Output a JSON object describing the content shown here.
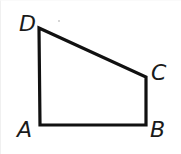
{
  "figure": {
    "kind": "geometry-diagram",
    "shape_name": "quadrilateral",
    "canvas": {
      "width": 181,
      "height": 154,
      "background": "#ffffff"
    },
    "stroke": {
      "color": "#111111",
      "width": 3.2,
      "linejoin": "miter",
      "linecap": "butt"
    },
    "vertices": [
      {
        "id": "A",
        "label": "A",
        "x": 39,
        "y": 124,
        "label_x": 16,
        "label_y": 118
      },
      {
        "id": "B",
        "label": "B",
        "x": 145,
        "y": 124,
        "label_x": 149,
        "label_y": 118
      },
      {
        "id": "C",
        "label": "C",
        "x": 145,
        "y": 76,
        "label_x": 150,
        "label_y": 61
      },
      {
        "id": "D",
        "label": "D",
        "x": 38,
        "y": 27,
        "label_x": 18,
        "label_y": 12
      }
    ],
    "edges": [
      {
        "from": "A",
        "to": "B",
        "name": "side-AB"
      },
      {
        "from": "B",
        "to": "C",
        "name": "side-BC"
      },
      {
        "from": "C",
        "to": "D",
        "name": "side-CD"
      },
      {
        "from": "D",
        "to": "A",
        "name": "side-DA"
      }
    ],
    "path": "M 38,27 L 145,76 L 145,124 L 39,124 Z",
    "artifacts": [
      {
        "id": "speck-1",
        "x": 57,
        "y": 19,
        "color": "#c9c9c9"
      }
    ]
  }
}
